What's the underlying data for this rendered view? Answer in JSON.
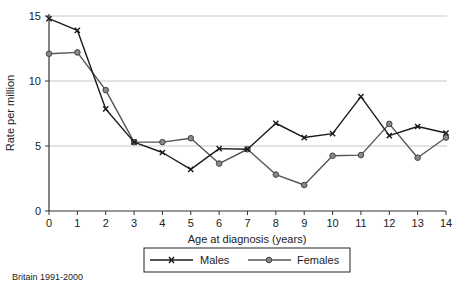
{
  "chart_data": {
    "type": "line",
    "title": "",
    "xlabel": "Age at diagnosis (years)",
    "ylabel": "Rate per million",
    "x": [
      0,
      1,
      2,
      3,
      4,
      5,
      6,
      7,
      8,
      9,
      10,
      11,
      12,
      13,
      14
    ],
    "xticks": [
      "0",
      "1",
      "2",
      "3",
      "4",
      "5",
      "6",
      "7",
      "8",
      "9",
      "10",
      "11",
      "12",
      "13",
      "14"
    ],
    "yticks": [
      "0",
      "5",
      "10",
      "15"
    ],
    "ylim": [
      0,
      15
    ],
    "xlim": [
      0,
      14
    ],
    "grid": {
      "y": true,
      "x": false,
      "lines_at": [
        5,
        10,
        15
      ]
    },
    "legend_position": "bottom",
    "series": [
      {
        "name": "Males",
        "marker": "x",
        "color": "#1a1a1a",
        "values": [
          14.8,
          13.9,
          7.85,
          5.3,
          4.5,
          3.2,
          4.8,
          4.75,
          6.75,
          5.65,
          5.95,
          8.8,
          5.8,
          6.5,
          6.0
        ]
      },
      {
        "name": "Females",
        "marker": "circle",
        "color": "#555555",
        "values": [
          12.1,
          12.2,
          9.3,
          5.3,
          5.3,
          5.6,
          3.65,
          4.75,
          2.8,
          2.0,
          4.25,
          4.3,
          6.7,
          4.1,
          5.65
        ]
      }
    ]
  },
  "footnote": "Britain 1991-2000"
}
